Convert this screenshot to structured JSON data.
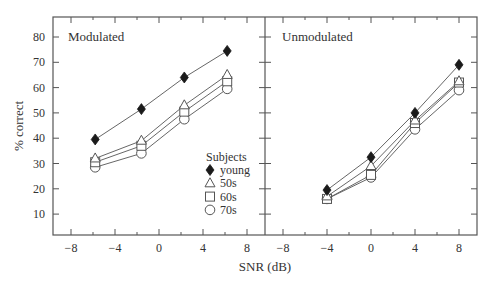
{
  "chart_data": {
    "type": "line",
    "xlabel": "SNR (dB)",
    "ylabel": "% correct",
    "ylim": [
      0,
      85
    ],
    "yticks": [
      10,
      20,
      30,
      40,
      50,
      60,
      70,
      80
    ],
    "xticks": [
      -8,
      -4,
      0,
      4,
      8
    ],
    "grid": false,
    "legend": {
      "title": "Subjects",
      "position": "inside lower-right of left panel",
      "entries": [
        {
          "label": "young",
          "marker": "filled-diamond"
        },
        {
          "label": "50s",
          "marker": "open-triangle"
        },
        {
          "label": "60s",
          "marker": "open-square"
        },
        {
          "label": "70s",
          "marker": "open-circle"
        }
      ]
    },
    "panels": [
      {
        "title": "Modulated",
        "xlim": [
          -10,
          10
        ],
        "series": [
          {
            "name": "young",
            "x": [
              -5.8,
              -1.6,
              2.3,
              6.2
            ],
            "values": [
              39.5,
              51.5,
              64,
              74.5
            ]
          },
          {
            "name": "50s",
            "x": [
              -5.8,
              -1.6,
              2.3,
              6.2
            ],
            "values": [
              32,
              39,
              53,
              65
            ]
          },
          {
            "name": "60s",
            "x": [
              -5.8,
              -1.6,
              2.3,
              6.2
            ],
            "values": [
              30.5,
              37,
              50.5,
              62.5
            ]
          },
          {
            "name": "70s",
            "x": [
              -5.8,
              -1.6,
              2.3,
              6.2
            ],
            "values": [
              28.5,
              34,
              47.5,
              59.5
            ]
          }
        ]
      },
      {
        "title": "Unmodulated",
        "xlim": [
          -10,
          10
        ],
        "series": [
          {
            "name": "young",
            "x": [
              -4,
              0,
              4,
              8
            ],
            "values": [
              19.5,
              32.5,
              50,
              69
            ]
          },
          {
            "name": "50s",
            "x": [
              -4,
              0,
              4,
              8
            ],
            "values": [
              17,
              29,
              47,
              62.5
            ]
          },
          {
            "name": "60s",
            "x": [
              -4,
              0,
              4,
              8
            ],
            "values": [
              16,
              25.5,
              46,
              62
            ]
          },
          {
            "name": "70s",
            "x": [
              -4,
              0,
              4,
              8
            ],
            "values": [
              16,
              24.5,
              43.5,
              59
            ]
          }
        ]
      }
    ]
  }
}
